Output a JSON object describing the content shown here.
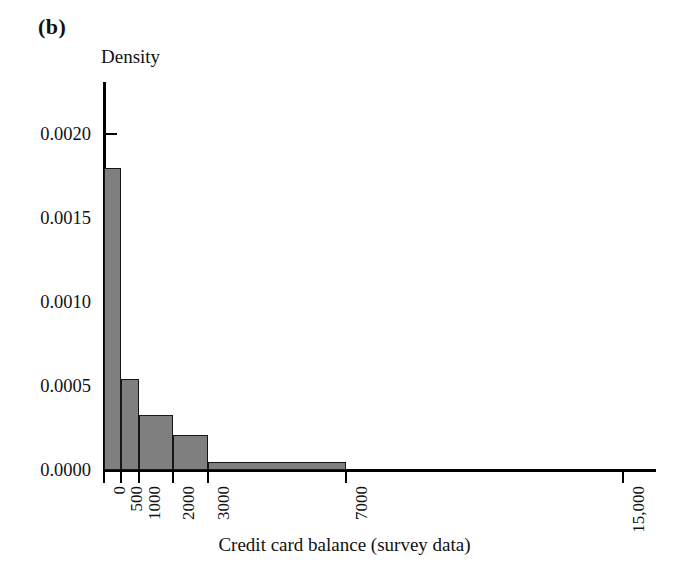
{
  "figure": {
    "panel_label": "(b)",
    "x_axis_title": "Credit card balance (survey data)",
    "y_axis_title": "Density",
    "bar_fill_color": "#807f7f",
    "bar_edge_color": "#15161a",
    "axis_color": "#000000",
    "background_color": "#ffffff"
  },
  "chart_data": {
    "type": "bar",
    "title": "",
    "subtitle": "",
    "panel": "(b)",
    "xlabel": "Credit card balance (survey data)",
    "ylabel": "Density",
    "xlim": [
      0,
      15000
    ],
    "ylim": [
      0.0,
      0.002
    ],
    "grid": false,
    "legend": null,
    "x_tick_labels": [
      "0",
      "500",
      "1000",
      "2000",
      "3000",
      "7000",
      "15,000"
    ],
    "x_tick_values": [
      0,
      500,
      1000,
      2000,
      3000,
      7000,
      15000
    ],
    "y_tick_labels": [
      "0.0000",
      "0.0005",
      "0.0010",
      "0.0015",
      "0.0020"
    ],
    "y_tick_values": [
      0.0,
      0.0005,
      0.001,
      0.0015,
      0.002
    ],
    "bin_edges": [
      0,
      500,
      1000,
      2000,
      3000,
      7000
    ],
    "categories": [
      "0–500",
      "500–1000",
      "1000–2000",
      "2000–3000",
      "3000–7000"
    ],
    "values": [
      0.0018,
      0.00054,
      0.00033,
      0.00021,
      5e-05
    ],
    "bars": [
      {
        "label": "0–500",
        "x0": 0,
        "x1": 500,
        "density": 0.0018
      },
      {
        "label": "500–1000",
        "x0": 500,
        "x1": 1000,
        "density": 0.00054
      },
      {
        "label": "1000–2000",
        "x0": 1000,
        "x1": 2000,
        "density": 0.00033
      },
      {
        "label": "2000–3000",
        "x0": 2000,
        "x1": 3000,
        "density": 0.00021
      },
      {
        "label": "3000–7000",
        "x0": 3000,
        "x1": 7000,
        "density": 5e-05
      }
    ]
  }
}
